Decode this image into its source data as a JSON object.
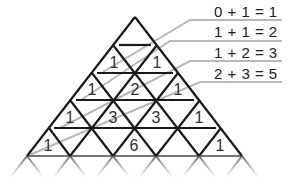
{
  "diagram": {
    "equations": [
      {
        "text": "0 + 1 = 1"
      },
      {
        "text": "1 + 1 = 2"
      },
      {
        "text": "1 + 2 = 3"
      },
      {
        "text": "2 + 3 = 5"
      }
    ],
    "rows": [
      {
        "values": [
          "1",
          "1"
        ]
      },
      {
        "values": [
          "1",
          "2",
          "1"
        ]
      },
      {
        "values": [
          "1",
          "3",
          "3",
          "1"
        ]
      },
      {
        "values": [
          "1",
          "",
          "6",
          "",
          "1"
        ]
      }
    ],
    "colors": {
      "grid_line": "#1a1a1a",
      "diagonal_line": "#b0b0b0",
      "text": "#222222",
      "background": "#ffffff"
    }
  }
}
